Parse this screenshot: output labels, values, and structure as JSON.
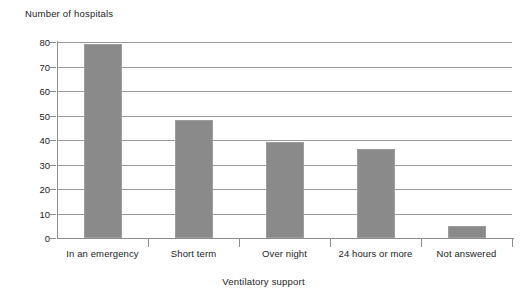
{
  "chart_data": {
    "type": "bar",
    "title": "",
    "ylabel": "Number of hospitals",
    "xlabel": "Ventilatory support",
    "categories": [
      "In an emergency",
      "Short term",
      "Over night",
      "24 hours or more",
      "Not answered"
    ],
    "values": [
      79,
      48,
      39,
      36.5,
      5
    ],
    "ylim": [
      0,
      80
    ],
    "ytick_labels": [
      "0",
      "10",
      "20",
      "30",
      "40",
      "50",
      "60",
      "70",
      "80"
    ],
    "ytick_values": [
      0,
      10,
      20,
      30,
      40,
      50,
      60,
      70,
      80
    ],
    "grid": "horizontal",
    "legend": "none",
    "bar_color": "#8a8a8a",
    "axis_color": "#8d8d8d",
    "grid_color": "#9a9a9a",
    "background_color": "#ffffff"
  }
}
